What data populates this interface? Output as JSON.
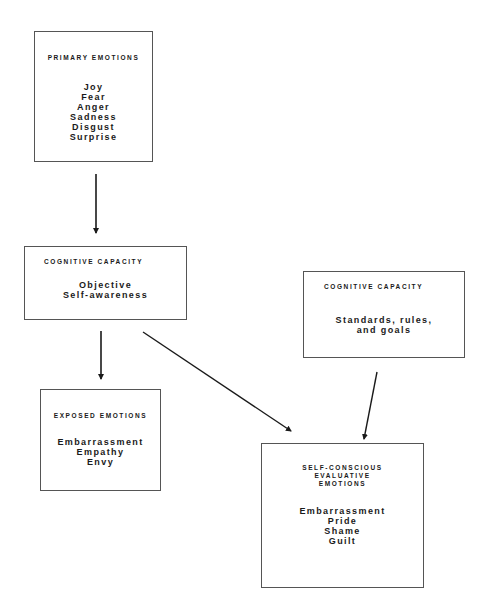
{
  "diagram": {
    "nodes": [
      {
        "id": "primary",
        "title": "PRIMARY EMOTIONS",
        "items": [
          "Joy",
          "Fear",
          "Anger",
          "Sadness",
          "Disgust",
          "Surprise"
        ]
      },
      {
        "id": "cognitive-self",
        "title": "COGNITIVE CAPACITY",
        "items": [
          "Objective",
          "Self-awareness"
        ]
      },
      {
        "id": "cognitive-standards",
        "title": "COGNITIVE CAPACITY",
        "items": [
          "Standards, rules,",
          "and goals"
        ]
      },
      {
        "id": "exposed",
        "title": "EXPOSED EMOTIONS",
        "items": [
          "Embarrassment",
          "Empathy",
          "Envy"
        ]
      },
      {
        "id": "self-conscious",
        "title_lines": [
          "SELF-CONSCIOUS",
          "EVALUATIVE",
          "EMOTIONS"
        ],
        "items": [
          "Embarrassment",
          "Pride",
          "Shame",
          "Guilt"
        ]
      }
    ],
    "edges": [
      {
        "from": "primary",
        "to": "cognitive-self"
      },
      {
        "from": "cognitive-self",
        "to": "exposed"
      },
      {
        "from": "cognitive-self",
        "to": "self-conscious"
      },
      {
        "from": "cognitive-standards",
        "to": "self-conscious"
      }
    ],
    "colors": {
      "line": "#1a1a1a",
      "border": "#555555"
    }
  }
}
